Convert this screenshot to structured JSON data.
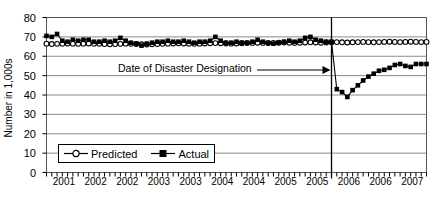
{
  "chart_data": {
    "type": "line",
    "title": "",
    "subtitle": "",
    "xlabel": "",
    "ylabel": "Number in 1,000s",
    "ylim": [
      0,
      80
    ],
    "yticks": [
      0,
      10,
      20,
      30,
      40,
      50,
      60,
      70,
      80
    ],
    "xtick_labels": [
      "2001",
      "2002",
      "2002",
      "2003",
      "2003",
      "2004",
      "2004",
      "2005",
      "2005",
      "2006",
      "2006",
      "2007"
    ],
    "grid": "horizontal",
    "legend_position": "inside-lower-left",
    "x_minor_tick_count": 73,
    "annotations": [
      {
        "text": "Date of Disaster Designation",
        "kind": "arrow-label",
        "points_to": "vertical-line-at-disaster-date",
        "x_value": 54
      }
    ],
    "vertical_marker": {
      "label": "Date of Disaster Designation",
      "x_index": 54
    },
    "x": [
      0,
      1,
      2,
      3,
      4,
      5,
      6,
      7,
      8,
      9,
      10,
      11,
      12,
      13,
      14,
      15,
      16,
      17,
      18,
      19,
      20,
      21,
      22,
      23,
      24,
      25,
      26,
      27,
      28,
      29,
      30,
      31,
      32,
      33,
      34,
      35,
      36,
      37,
      38,
      39,
      40,
      41,
      42,
      43,
      44,
      45,
      46,
      47,
      48,
      49,
      50,
      51,
      52,
      53,
      54,
      55,
      56,
      57,
      58,
      59,
      60,
      61,
      62,
      63,
      64,
      65,
      66,
      67,
      68,
      69,
      70,
      71,
      72
    ],
    "series": [
      {
        "name": "Predicted",
        "marker": "open-circle",
        "color": "#000000",
        "values": [
          66.5,
          66.3,
          66.4,
          66.5,
          66.6,
          66.5,
          66.4,
          66.5,
          66.6,
          66.5,
          66.4,
          66.3,
          66.2,
          66.3,
          66.4,
          66.5,
          66.4,
          66.3,
          66.2,
          66.1,
          66.2,
          66.3,
          66.4,
          66.5,
          66.6,
          66.7,
          66.6,
          66.5,
          66.4,
          66.5,
          66.6,
          66.7,
          66.8,
          66.7,
          66.6,
          66.5,
          66.6,
          66.7,
          66.8,
          66.9,
          67.0,
          66.9,
          66.8,
          66.9,
          67.0,
          67.1,
          67.0,
          66.9,
          67.0,
          67.1,
          67.2,
          67.1,
          67.0,
          67.1,
          67.2,
          67.3,
          67.2,
          67.1,
          67.2,
          67.3,
          67.4,
          67.3,
          67.2,
          67.3,
          67.4,
          67.5,
          67.4,
          67.3,
          67.4,
          67.5,
          67.4,
          67.3,
          67.4
        ]
      },
      {
        "name": "Actual",
        "marker": "filled-square",
        "color": "#000000",
        "values": [
          70.5,
          70.0,
          71.5,
          68.0,
          67.5,
          68.5,
          68.0,
          68.5,
          68.5,
          67.5,
          67.5,
          68.0,
          67.5,
          68.0,
          69.5,
          68.0,
          67.0,
          66.5,
          65.5,
          66.5,
          67.0,
          67.5,
          67.5,
          68.0,
          67.5,
          67.5,
          68.0,
          67.5,
          67.0,
          67.5,
          67.5,
          68.0,
          70.0,
          68.0,
          67.0,
          67.0,
          67.5,
          67.0,
          67.0,
          67.5,
          68.5,
          67.5,
          67.0,
          66.5,
          67.0,
          67.5,
          68.0,
          67.5,
          68.0,
          69.5,
          70.0,
          68.5,
          68.0,
          67.5,
          67.5,
          43.0,
          41.5,
          39.0,
          42.5,
          45.0,
          47.5,
          49.5,
          51.0,
          52.5,
          53.0,
          54.0,
          55.5,
          56.0,
          55.0,
          54.5,
          56.0,
          56.0,
          56.0
        ]
      }
    ]
  },
  "legend": {
    "items": [
      {
        "label": "Predicted",
        "marker": "open-circle"
      },
      {
        "label": "Actual",
        "marker": "filled-square"
      }
    ]
  }
}
